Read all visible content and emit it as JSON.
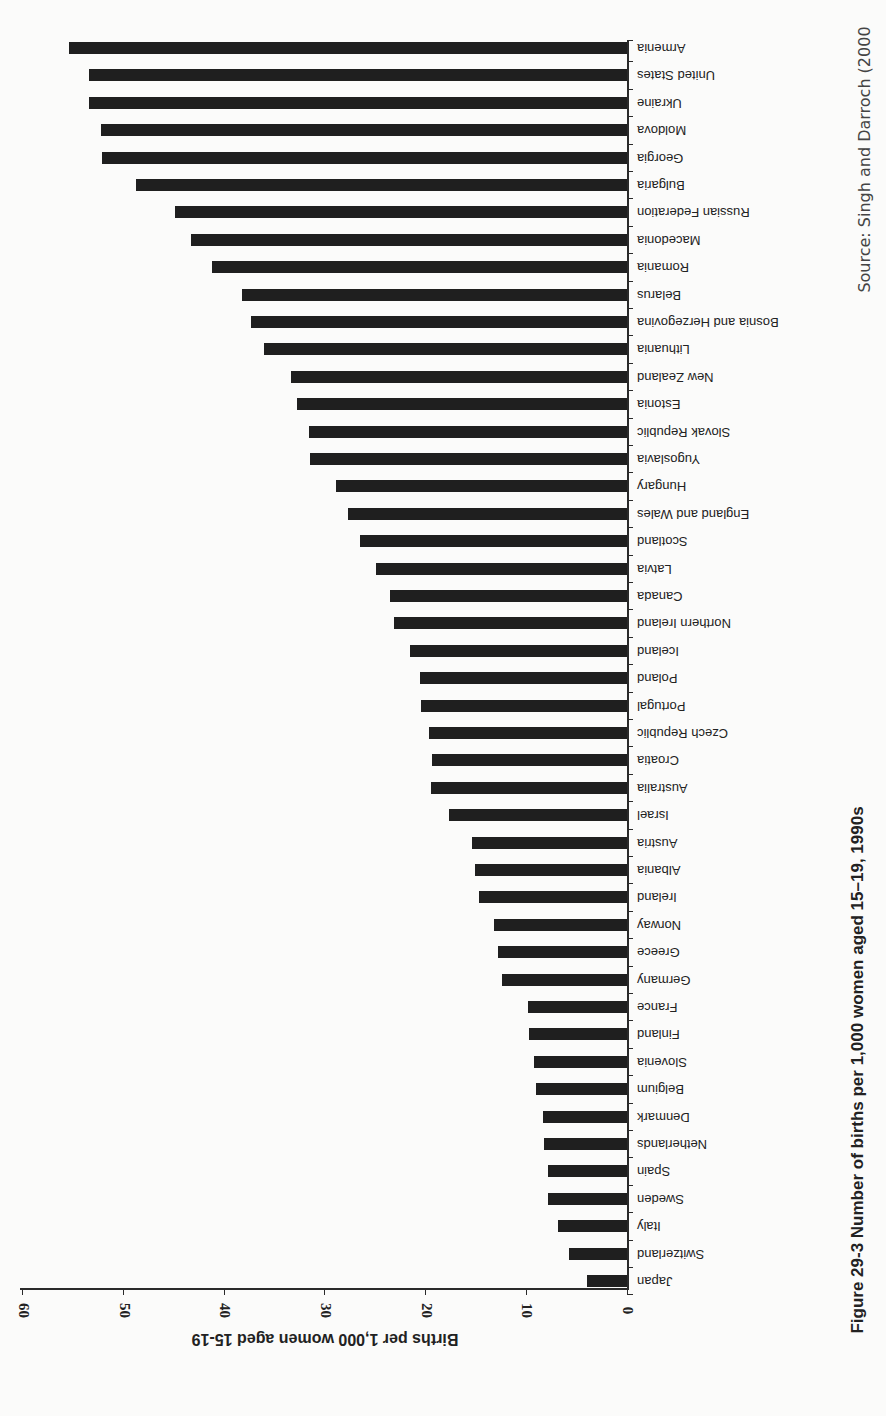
{
  "figure": {
    "caption": "Figure 29-3  Number of births per 1,000 women aged 15–19, 1990s",
    "source": "Source: Singh and Darroch (2000"
  },
  "chart_data": {
    "type": "bar",
    "orientation": "horizontal (figure printed rotated 180°)",
    "title": "Number of births per 1,000 women aged 15–19, 1990s",
    "xlabel": "Births per 1,000 women aged 15-19",
    "ylabel": "",
    "xlim": [
      0,
      60
    ],
    "x_ticks": [
      "0",
      "10",
      "20",
      "30",
      "40",
      "50",
      "60"
    ],
    "grid": false,
    "legend": null,
    "bar_color": "#1f1f1f",
    "categories": [
      "Armenia",
      "United States",
      "Ukraine",
      "Moldova",
      "Georgia",
      "Bulgaria",
      "Russian Federation",
      "Macedonia",
      "Romania",
      "Belarus",
      "Bosnia and Herzegovina",
      "Lithuania",
      "New Zealand",
      "Estonia",
      "Slovak Republic",
      "Yugoslavia",
      "Hungary",
      "England and Wales",
      "Scotland",
      "Latvia",
      "Canada",
      "Northern Ireland",
      "Iceland",
      "Poland",
      "Portugal",
      "Czech Republic",
      "Croatia",
      "Australia",
      "Israel",
      "Austria",
      "Albania",
      "Ireland",
      "Norway",
      "Greece",
      "Germany",
      "France",
      "Finland",
      "Slovenia",
      "Belgium",
      "Denmark",
      "Netherlands",
      "Spain",
      "Sweden",
      "Italy",
      "Switzerland",
      "Japan"
    ],
    "values": [
      55.4,
      53.4,
      53.4,
      52.2,
      52.1,
      48.8,
      44.9,
      43.3,
      41.2,
      38.2,
      37.3,
      36.0,
      33.4,
      32.8,
      31.6,
      31.5,
      28.9,
      27.7,
      26.5,
      24.9,
      23.5,
      23.1,
      21.5,
      20.6,
      20.5,
      19.7,
      19.4,
      19.5,
      17.7,
      15.4,
      15.1,
      14.7,
      13.2,
      12.8,
      12.4,
      9.8,
      9.7,
      9.2,
      9.0,
      8.3,
      8.2,
      7.8,
      7.8,
      6.9,
      5.8,
      4.0
    ]
  }
}
